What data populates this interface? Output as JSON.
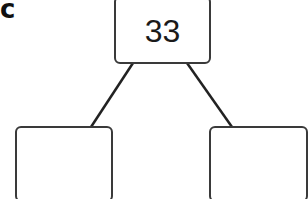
{
  "figure_label": "c",
  "tree": {
    "root": {
      "value": "33"
    },
    "children": [
      {
        "position": "left",
        "value": ""
      },
      {
        "position": "right",
        "value": ""
      }
    ]
  },
  "colors": {
    "stroke": "#3a3a3a",
    "background": "#ffffff"
  }
}
